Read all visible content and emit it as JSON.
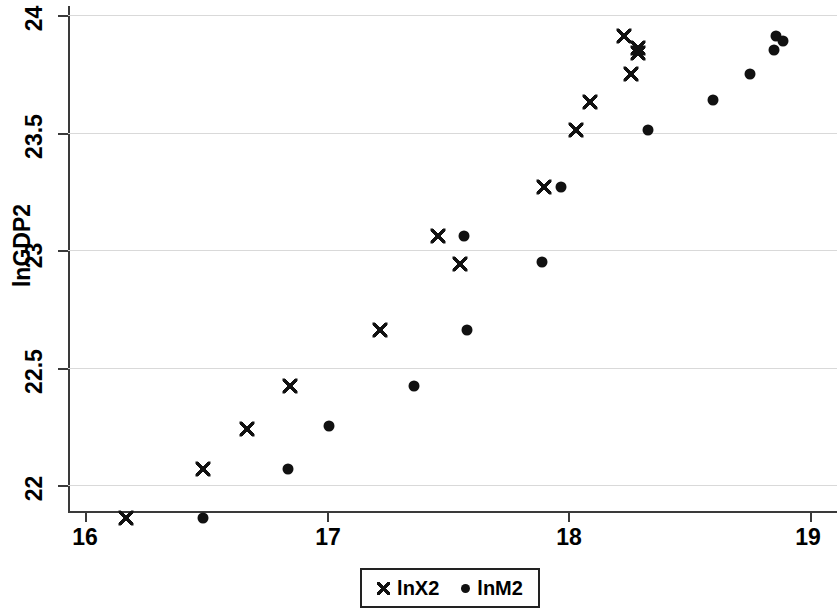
{
  "chart_data": {
    "type": "scatter",
    "title": "",
    "xlabel": "",
    "ylabel": "lnGDP2",
    "xlim": [
      15.93,
      19.0
    ],
    "ylim": [
      21.79,
      24.04
    ],
    "xticks": [
      "16",
      "17",
      "18",
      "19"
    ],
    "xtick_values": [
      16,
      17,
      18,
      19
    ],
    "yticks": [
      "22",
      "22.5",
      "23",
      "23.5",
      "24"
    ],
    "ytick_values": [
      22,
      22.5,
      23,
      23.5,
      24
    ],
    "grid": "horizontal",
    "grid_color": "#d9d9d9",
    "legend_position": "bottom-center",
    "marker_color": "#111111",
    "series": [
      {
        "name": "lnX2",
        "marker": "x",
        "points": [
          [
            16.17,
            21.86
          ],
          [
            16.49,
            22.07
          ],
          [
            16.67,
            22.24
          ],
          [
            16.85,
            22.42
          ],
          [
            17.22,
            22.66
          ],
          [
            17.46,
            23.06
          ],
          [
            17.55,
            22.94
          ],
          [
            17.9,
            23.27
          ],
          [
            18.03,
            23.51
          ],
          [
            18.09,
            23.63
          ],
          [
            18.23,
            23.91
          ],
          [
            18.29,
            23.86
          ],
          [
            18.29,
            23.84
          ],
          [
            18.26,
            23.75
          ]
        ]
      },
      {
        "name": "lnM2",
        "marker": "o",
        "points": [
          [
            16.49,
            21.86
          ],
          [
            16.84,
            22.07
          ],
          [
            17.01,
            22.25
          ],
          [
            17.36,
            22.42
          ],
          [
            17.57,
            23.06
          ],
          [
            17.58,
            22.66
          ],
          [
            17.89,
            22.95
          ],
          [
            17.97,
            23.27
          ],
          [
            18.33,
            23.51
          ],
          [
            18.6,
            23.64
          ],
          [
            18.75,
            23.75
          ],
          [
            18.86,
            23.91
          ],
          [
            18.89,
            23.89
          ],
          [
            18.85,
            23.85
          ]
        ]
      }
    ]
  },
  "axes": {
    "y_title": "lnGDP2",
    "y_tick_labels": [
      "24",
      "23.5",
      "23",
      "22.5",
      "22"
    ],
    "x_tick_labels": [
      "16",
      "17",
      "18",
      "19"
    ]
  },
  "legend": {
    "items": [
      {
        "label": "lnX2",
        "symbol": "x-marker"
      },
      {
        "label": "lnM2",
        "symbol": "dot-marker"
      }
    ]
  }
}
